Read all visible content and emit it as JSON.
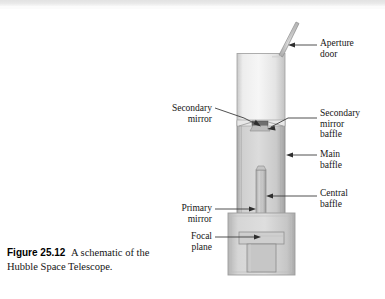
{
  "figure": {
    "number": "Figure 25.12",
    "caption": "A schematic of the Hubble Space Telescope."
  },
  "labels": {
    "aperture_door": "Aperture\ndoor",
    "secondary_mirror": "Secondary\nmirror",
    "secondary_mirror_baffle": "Secondary\nmirror\nbaffle",
    "main_baffle": "Main\nbaffle",
    "central_baffle": "Central\nbaffle",
    "primary_mirror": "Primary\nmirror",
    "focal_plane": "Focal\nplane"
  },
  "parts": [
    {
      "name": "aperture-door",
      "label": "Aperture door",
      "side": "right"
    },
    {
      "name": "secondary-mirror",
      "label": "Secondary mirror",
      "side": "left"
    },
    {
      "name": "secondary-mirror-baffle",
      "label": "Secondary mirror baffle",
      "side": "right"
    },
    {
      "name": "main-baffle",
      "label": "Main baffle",
      "side": "right"
    },
    {
      "name": "central-baffle",
      "label": "Central baffle",
      "side": "right"
    },
    {
      "name": "primary-mirror",
      "label": "Primary mirror",
      "side": "left"
    },
    {
      "name": "focal-plane",
      "label": "Focal plane",
      "side": "left"
    }
  ],
  "colors": {
    "page_background": "#ffffff",
    "text": "#161616",
    "leader_line": "#444444",
    "tube_light": "#f2f2f2",
    "tube_mid": "#d8d8d8",
    "tube_shadow": "#b8b8b8",
    "housing": "#c9c9c9",
    "scan_band": "#e2e2e2"
  }
}
